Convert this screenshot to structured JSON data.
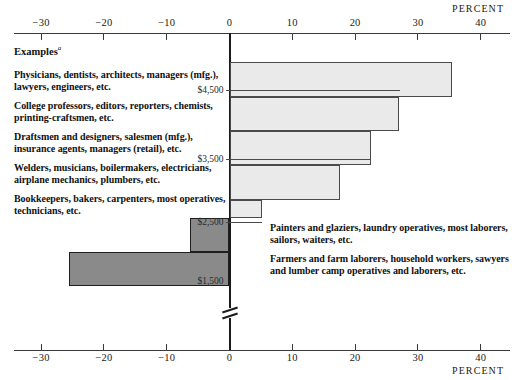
{
  "axis": {
    "unit_label_top": "PERCENT",
    "unit_label_bottom": "PERCENT",
    "ticks": [
      {
        "value": -30,
        "label": "−30"
      },
      {
        "value": -20,
        "label": "−20"
      },
      {
        "value": -10,
        "label": "−10"
      },
      {
        "value": 0,
        "label": "0"
      },
      {
        "value": 10,
        "label": "10"
      },
      {
        "value": 20,
        "label": "20"
      },
      {
        "value": 30,
        "label": "30"
      },
      {
        "value": 40,
        "label": "40"
      }
    ]
  },
  "examples_heading": "Examples",
  "examples_heading_footnote": "a",
  "income_labels": [
    {
      "label": "$4,500"
    },
    {
      "label": "$3,500"
    },
    {
      "label": "$2,500"
    },
    {
      "label": "$1,500"
    }
  ],
  "left_blocks": [
    {
      "text": "Physicians, dentists, architects, managers (mfg.), lawyers, engineers, etc."
    },
    {
      "text": "College professors, editors, reporters, chemists, printing-craftsmen, etc."
    },
    {
      "text": "Draftsmen and designers, salesmen (mfg.), insurance agents, managers (retail), etc."
    },
    {
      "text": "Welders, musicians, boilermakers, electricians, airplane mechanics, plumbers, etc."
    },
    {
      "text": "Bookkeepers, bakers, carpenters, most operatives, technicians, etc."
    }
  ],
  "right_blocks": [
    {
      "text": "Painters and glaziers, laundry operatives, most laborers, sailors, waiters, etc."
    },
    {
      "text": "Farmers and farm laborers, household workers, sawyers and lumber camp operatives and laborers, etc."
    }
  ],
  "chart_data": {
    "type": "bar",
    "orientation": "horizontal",
    "title": "",
    "xlabel": "PERCENT",
    "ylabel": "",
    "xlim": [
      -33,
      44
    ],
    "grid": false,
    "legend": null,
    "categories": [
      "Physicians, dentists, architects, managers (mfg.), lawyers, engineers, etc.",
      "College professors, editors, reporters, chemists, printing-craftsmen, etc.",
      "Draftsmen and designers, salesmen (mfg.), insurance agents, managers (retail), etc.",
      "Welders, musicians, boilermakers, electricians, airplane mechanics, plumbers, etc.",
      "Bookkeepers, bakers, carpenters, most operatives, technicians, etc.",
      "Painters and glaziers, laundry operatives, most laborers, sailors, waiters, etc.",
      "Farmers and farm laborers, household workers, sawyers and lumber camp operatives and laborers, etc."
    ],
    "values": [
      35.4,
      27.0,
      22.5,
      17.6,
      5.2,
      -6.3,
      -25.5
    ],
    "tick_values": [
      -30,
      -20,
      -10,
      0,
      10,
      20,
      30,
      40
    ],
    "income_breaks": [
      4500,
      3500,
      2500,
      1500
    ],
    "colors": {
      "positive": "#eaeaea",
      "negative": "#8a8a8a",
      "outline": "#4a4a4a"
    }
  }
}
